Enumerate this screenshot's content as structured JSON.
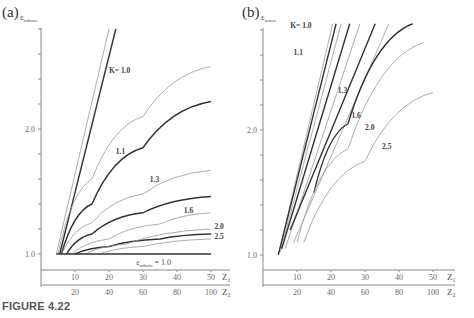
{
  "caption": "FIGURE 4.22",
  "chart_data": [
    {
      "panel": "(a)",
      "type": "line",
      "ylabel": "ε_αdmax",
      "xlabel_primary": "Z1",
      "xlabel_secondary": "Z2",
      "x_ticks_primary": [
        10,
        20,
        30,
        40,
        50
      ],
      "x_ticks_secondary": [
        20,
        40,
        60,
        80,
        100
      ],
      "y_ticks_labeled": [
        1.0,
        2.0
      ],
      "y_tick_step": 0.2,
      "ylim": [
        0.9,
        2.9
      ],
      "xlim": [
        0,
        55
      ],
      "annotation": "ε_αdmin = 1.0",
      "series": [
        {
          "name": "K=1.0 (thin)",
          "weight": "thin",
          "x": [
            4.5,
            20
          ],
          "y": [
            1.0,
            2.8
          ]
        },
        {
          "name": "K=1.0 (bold)",
          "weight": "bold",
          "x": [
            5.5,
            22
          ],
          "y": [
            1.0,
            2.8
          ]
        },
        {
          "name": "K=1.1 (thin)",
          "weight": "thin",
          "x": [
            5,
            15,
            30,
            50
          ],
          "y": [
            1.0,
            1.6,
            2.1,
            2.5
          ]
        },
        {
          "name": "K=1.1 (bold)",
          "weight": "bold",
          "x": [
            6,
            15,
            30,
            50
          ],
          "y": [
            1.0,
            1.4,
            1.85,
            2.22
          ]
        },
        {
          "name": "K=1.3 (thin)",
          "weight": "thin",
          "x": [
            6,
            15,
            30,
            50
          ],
          "y": [
            1.0,
            1.25,
            1.48,
            1.67
          ]
        },
        {
          "name": "K=1.3 (bold)",
          "weight": "bold",
          "x": [
            7.5,
            15,
            30,
            50
          ],
          "y": [
            1.0,
            1.16,
            1.33,
            1.46
          ]
        },
        {
          "name": "K=1.6 (thin)",
          "weight": "thin",
          "x": [
            9,
            20,
            35,
            50
          ],
          "y": [
            1.0,
            1.12,
            1.24,
            1.33
          ]
        },
        {
          "name": "K=1.6 (bold)",
          "weight": "bold",
          "x": [
            10,
            20,
            35,
            50
          ],
          "y": [
            1.0,
            1.06,
            1.12,
            1.16
          ]
        },
        {
          "name": "K=2.0",
          "weight": "thin",
          "x": [
            13,
            25,
            50
          ],
          "y": [
            1.0,
            1.08,
            1.2
          ]
        },
        {
          "name": "K=2.5",
          "weight": "thin",
          "x": [
            17,
            30,
            50
          ],
          "y": [
            1.0,
            1.06,
            1.12
          ]
        },
        {
          "name": "ε_αdmin=1.0",
          "weight": "bold",
          "x": [
            4.5,
            50
          ],
          "y": [
            1.0,
            1.0
          ]
        }
      ],
      "labels": [
        {
          "text": "K= 1.0",
          "x": 20,
          "y": 2.45
        },
        {
          "text": "1.1",
          "x": 22,
          "y": 1.8
        },
        {
          "text": "1.3",
          "x": 32,
          "y": 1.58
        },
        {
          "text": "1.6",
          "x": 42,
          "y": 1.33
        },
        {
          "text": "2.0",
          "x": 51,
          "y": 1.2
        },
        {
          "text": "2.5",
          "x": 51,
          "y": 1.12
        }
      ]
    },
    {
      "panel": "(b)",
      "type": "line",
      "ylabel": "ε_αmax",
      "xlabel_primary": "Z1",
      "xlabel_secondary": "Z2",
      "x_ticks_primary": [
        10,
        20,
        30,
        40,
        50
      ],
      "x_ticks_secondary": [
        20,
        40,
        60,
        80,
        100
      ],
      "y_ticks_labeled": [
        1.0,
        2.0
      ],
      "y_tick_step": 0.2,
      "ylim": [
        0.9,
        2.9
      ],
      "xlim": [
        0,
        55
      ],
      "series": [
        {
          "name": "K=1.0 a",
          "weight": "thin",
          "x": [
            4.5,
            20.5
          ],
          "y": [
            1.0,
            2.85
          ]
        },
        {
          "name": "K=1.0 b",
          "weight": "bold",
          "x": [
            4.5,
            21.5
          ],
          "y": [
            1.0,
            2.85
          ]
        },
        {
          "name": "K=1.1 a",
          "weight": "thin",
          "x": [
            5,
            23
          ],
          "y": [
            1.02,
            2.85
          ]
        },
        {
          "name": "K=1.1 b",
          "weight": "bold",
          "x": [
            5.5,
            25.5
          ],
          "y": [
            1.05,
            2.85
          ]
        },
        {
          "name": "K=1.3 a",
          "weight": "thin",
          "x": [
            6.5,
            28.5
          ],
          "y": [
            1.05,
            2.85
          ]
        },
        {
          "name": "K=1.3 b",
          "weight": "bold",
          "x": [
            8,
            33
          ],
          "y": [
            1.2,
            2.85
          ]
        },
        {
          "name": "K=1.6 a",
          "weight": "thin",
          "x": [
            9,
            37
          ],
          "y": [
            1.1,
            2.85
          ]
        },
        {
          "name": "K=1.6 b",
          "weight": "bold",
          "x": [
            15,
            25,
            44
          ],
          "y": [
            1.5,
            2.05,
            2.85
          ]
        },
        {
          "name": "K=2.0",
          "weight": "thin",
          "x": [
            10,
            25,
            47
          ],
          "y": [
            1.1,
            1.85,
            2.7
          ]
        },
        {
          "name": "K=2.5",
          "weight": "thin",
          "x": [
            12,
            30,
            50
          ],
          "y": [
            1.1,
            1.75,
            2.3
          ]
        }
      ],
      "labels": [
        {
          "text": "K= 1.0",
          "x": 8,
          "y": 2.82
        },
        {
          "text": "1.1",
          "x": 9,
          "y": 2.6
        },
        {
          "text": "1.3",
          "x": 22,
          "y": 2.3
        },
        {
          "text": "1.6",
          "x": 26,
          "y": 2.1
        },
        {
          "text": "2.0",
          "x": 30,
          "y": 2.0
        },
        {
          "text": "2.5",
          "x": 35,
          "y": 1.85
        }
      ]
    }
  ]
}
